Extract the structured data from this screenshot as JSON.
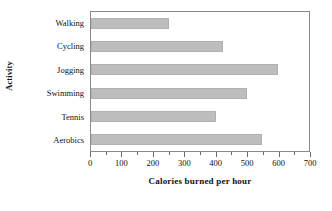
{
  "chart_data": {
    "type": "bar",
    "orientation": "horizontal",
    "title": "",
    "xlabel": "Calories burned per hour",
    "ylabel": "Activity",
    "categories": [
      "Walking",
      "Cycling",
      "Jogging",
      "Swimming",
      "Tennis",
      "Aerobics"
    ],
    "values": [
      250,
      425,
      600,
      500,
      400,
      550
    ],
    "xlim": [
      0,
      700
    ],
    "xticks": [
      0,
      100,
      200,
      300,
      400,
      500,
      600,
      700
    ],
    "xtick_labels": [
      "0",
      "100",
      "200",
      "300",
      "400",
      "500",
      "600",
      "700"
    ],
    "minor_tick_step": 50,
    "grid": false,
    "legend": false,
    "bar_color": "#bdbdbd",
    "frame_color": "#8a8a8a"
  }
}
